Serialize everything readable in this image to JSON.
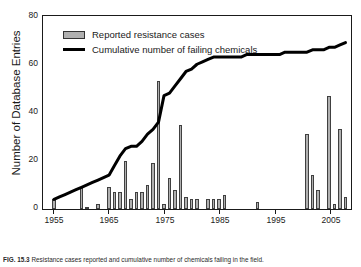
{
  "figure": {
    "caption_label": "FIG. 15.3",
    "caption_text": "Resistance cases reported and cumulative number of chemicals failing in the field."
  },
  "legend": {
    "position": "top-left-inside",
    "entries": [
      {
        "label": "Reported resistance cases",
        "marker": "bar-swatch",
        "color": "#b0b0b0"
      },
      {
        "label": "Cumulative number of failing chemicals",
        "marker": "line-swatch",
        "color": "#000000"
      }
    ]
  },
  "axes": {
    "y": {
      "label": "Number of Database Entries",
      "ticks": [
        0,
        20,
        40,
        60,
        80
      ],
      "tick_labels": [
        "0",
        "20",
        "40",
        "60",
        "80"
      ],
      "min": 0,
      "max": 80
    },
    "x": {
      "label": "",
      "ticks": [
        1955,
        1965,
        1975,
        1985,
        1995,
        2005
      ],
      "tick_labels": [
        "1955",
        "1965",
        "1975",
        "1985",
        "1995",
        "2005"
      ],
      "min": 1953,
      "max": 2009
    }
  },
  "chart_data": {
    "type": "bar",
    "title": "",
    "xlabel": "",
    "ylabel": "Number of Database Entries",
    "ylim": [
      0,
      80
    ],
    "xlim": [
      1953,
      2009
    ],
    "grid": false,
    "legend_position": "upper left",
    "x": [
      1955,
      1956,
      1957,
      1958,
      1959,
      1960,
      1961,
      1962,
      1963,
      1964,
      1965,
      1966,
      1967,
      1968,
      1969,
      1970,
      1971,
      1972,
      1973,
      1974,
      1975,
      1976,
      1977,
      1978,
      1979,
      1980,
      1981,
      1982,
      1983,
      1984,
      1985,
      1986,
      1987,
      1988,
      1989,
      1990,
      1991,
      1992,
      1993,
      1994,
      1995,
      1996,
      1997,
      1998,
      1999,
      2000,
      2001,
      2002,
      2003,
      2004,
      2005,
      2006,
      2007,
      2008
    ],
    "series": [
      {
        "name": "Reported resistance cases",
        "type": "bar",
        "color": "#b0b0b0",
        "edgecolor": "#404040",
        "values": [
          4,
          0,
          0,
          0,
          0,
          9,
          1,
          0,
          2,
          0,
          9,
          7,
          7,
          20,
          4,
          7,
          7,
          10,
          19,
          53,
          2,
          13,
          8,
          35,
          5,
          4,
          4,
          0,
          4,
          4,
          4,
          6,
          0,
          0,
          0,
          0,
          0,
          3,
          0,
          0,
          0,
          0,
          0,
          0,
          0,
          0,
          31,
          14,
          8,
          0,
          47,
          2,
          33,
          5
        ]
      },
      {
        "name": "Cumulative number of failing chemicals",
        "type": "line",
        "color": "#000000",
        "linewidth": 3,
        "values": [
          4,
          5,
          6,
          7,
          8,
          9,
          10,
          11,
          12,
          13,
          14,
          18,
          22,
          25,
          26,
          26,
          28,
          31,
          33,
          36,
          47,
          48,
          51,
          54,
          57,
          58,
          60,
          61,
          62,
          63,
          63,
          63,
          63,
          63,
          63,
          64,
          64,
          64,
          64,
          64,
          64,
          64,
          65,
          65,
          65,
          65,
          65,
          66,
          66,
          66,
          67,
          67,
          68,
          69
        ]
      }
    ]
  }
}
